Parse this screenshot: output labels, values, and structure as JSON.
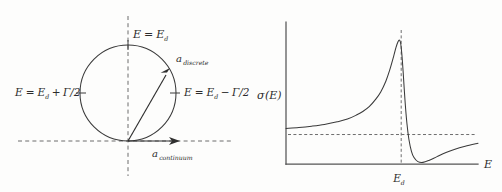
{
  "figure": {
    "background_color": "#fdfdfc",
    "ink_color": "#3a3a3a",
    "dashed_color": "#6d6d6d"
  },
  "left_panel": {
    "name": "argand-circle-diagram",
    "labels": {
      "top": {
        "lhs": "E",
        "eq": "=",
        "rhs_base": "E",
        "rhs_sub": "d",
        "full": "E = Ed"
      },
      "left": {
        "full": "E = Ed + Γ/2",
        "lhs": "E",
        "eq": "=",
        "base": "E",
        "sub": "d",
        "op": "+",
        "term": "Γ/2"
      },
      "right": {
        "full": "E = Ed − Γ/2",
        "lhs": "E",
        "eq": "=",
        "base": "E",
        "sub": "d",
        "op": "−",
        "term": "Γ/2"
      },
      "discrete_arrow": {
        "base": "a",
        "sub": "discrete",
        "full": "a discrete"
      },
      "continuum_arrow": {
        "base": "a",
        "sub": "continuum",
        "full": "a continuum"
      }
    },
    "geometry": {
      "circle_center_x": 128,
      "circle_center_y": 93,
      "circle_radius": 48,
      "origin_x": 128,
      "origin_y": 141,
      "discrete_tip_x": 170,
      "discrete_tip_y": 72,
      "continuum_tip_x": 178,
      "continuum_tip_y": 141
    }
  },
  "right_panel": {
    "name": "fano-lineshape-plot",
    "labels": {
      "y_axis": {
        "base": "σ",
        "arg": "(E)",
        "full": "σ(E)"
      },
      "x_axis": {
        "full": "E"
      },
      "x_tick": {
        "base": "E",
        "sub": "d",
        "full": "Ed"
      }
    }
  },
  "chart_data": {
    "type": "line",
    "title": "",
    "xlabel": "E",
    "ylabel": "σ(E)",
    "subtitle": "",
    "grid": false,
    "legend": null,
    "annotations": [
      {
        "text": "Ed",
        "kind": "x-tick",
        "x": 0.0,
        "note": "resonance energy, marked by vertical dashed line"
      },
      {
        "text": "σ(E)",
        "kind": "y-axis-label"
      },
      {
        "text": "E",
        "kind": "x-axis-label"
      }
    ],
    "reference_lines": [
      {
        "orientation": "vertical",
        "x": 0.0,
        "style": "dashed",
        "label": "Ed"
      },
      {
        "orientation": "horizontal",
        "y": 0.22,
        "style": "dashed",
        "label": "background continuum level"
      }
    ],
    "xlim": [
      -9,
      6
    ],
    "ylim": [
      0,
      1.0
    ],
    "series": [
      {
        "name": "Fano profile",
        "description": "Asymmetric Fano resonance cross-section: slow rise to a sharp peak just below Ed, steep drop to a near-zero minimum above Ed, then slow recovery toward the background level.",
        "x": [
          -9.0,
          -8.0,
          -7.0,
          -6.0,
          -5.0,
          -4.2,
          -3.5,
          -3.0,
          -2.5,
          -2.0,
          -1.6,
          -1.2,
          -0.9,
          -0.6,
          -0.4,
          -0.25,
          -0.15,
          -0.05,
          0.05,
          0.15,
          0.3,
          0.45,
          0.6,
          0.8,
          1.0,
          1.3,
          1.7,
          2.2,
          2.8,
          3.5,
          4.2,
          5.0,
          6.0
        ],
        "y": [
          0.265,
          0.272,
          0.282,
          0.295,
          0.315,
          0.335,
          0.365,
          0.392,
          0.428,
          0.482,
          0.538,
          0.618,
          0.7,
          0.8,
          0.872,
          0.912,
          0.925,
          0.905,
          0.82,
          0.69,
          0.47,
          0.3,
          0.185,
          0.095,
          0.048,
          0.018,
          0.012,
          0.028,
          0.055,
          0.085,
          0.11,
          0.132,
          0.155
        ]
      }
    ]
  }
}
